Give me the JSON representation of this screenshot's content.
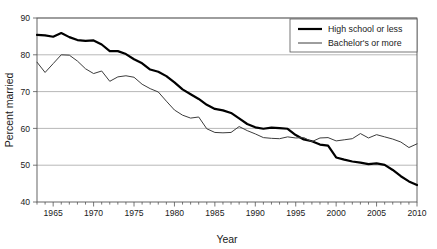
{
  "chart_data": {
    "type": "line",
    "title": "",
    "xlabel": "Year",
    "ylabel": "Percent married",
    "xlim": [
      1963,
      2010
    ],
    "ylim": [
      40,
      90
    ],
    "grid": true,
    "grid_axis": "y",
    "legend_position": "top-right",
    "x_ticks": [
      1965,
      1970,
      1975,
      1980,
      1985,
      1990,
      1995,
      2000,
      2005,
      2010
    ],
    "x_tick_labels": [
      "1965",
      "1970",
      "1975",
      "1980",
      "1985",
      "1990",
      "1995",
      "2000",
      "2005",
      "2010"
    ],
    "x_minor_tick_step": 1,
    "y_ticks": [
      40,
      50,
      60,
      70,
      80,
      90
    ],
    "y_tick_labels": [
      "40",
      "50",
      "60",
      "70",
      "80",
      "90"
    ],
    "x": [
      1963,
      1964,
      1965,
      1966,
      1967,
      1968,
      1969,
      1970,
      1971,
      1972,
      1973,
      1974,
      1975,
      1976,
      1977,
      1978,
      1979,
      1980,
      1981,
      1982,
      1983,
      1984,
      1985,
      1986,
      1987,
      1988,
      1989,
      1990,
      1991,
      1992,
      1993,
      1994,
      1995,
      1996,
      1997,
      1998,
      1999,
      2000,
      2001,
      2002,
      2003,
      2004,
      2005,
      2006,
      2007,
      2008,
      2009,
      2010
    ],
    "series": [
      {
        "name": "High school or less",
        "color": "#000000",
        "line_width": 2.2,
        "values": [
          85.4,
          85.3,
          84.9,
          85.9,
          84.8,
          84.0,
          83.8,
          83.9,
          82.8,
          81.0,
          81.0,
          80.2,
          78.8,
          77.7,
          76.0,
          75.4,
          74.2,
          72.5,
          70.6,
          69.3,
          68.0,
          66.4,
          65.3,
          64.9,
          64.2,
          62.7,
          61.2,
          60.3,
          59.9,
          60.2,
          60.1,
          59.9,
          58.2,
          57.0,
          56.5,
          55.6,
          55.3,
          54.9,
          54.1,
          54.6,
          54.8,
          54.6,
          54.2,
          53.9,
          53.3,
          52.6,
          52.3,
          51.8
        ]
      },
      {
        "name": "Bachelor's or more",
        "color": "#3c3c3c",
        "line_width": 1.0,
        "values": [
          78.0,
          75.2,
          77.6,
          80.0,
          79.9,
          78.3,
          76.2,
          74.9,
          75.6,
          72.8,
          74.0,
          74.3,
          73.9,
          72.0,
          70.8,
          69.9,
          67.4,
          65.0,
          63.6,
          62.8,
          63.1,
          59.9,
          58.9,
          58.8,
          58.9,
          60.5,
          59.4,
          58.5,
          57.5,
          57.3,
          57.2,
          57.7,
          57.4,
          57.5,
          56.4,
          57.4,
          57.5,
          57.0,
          56.4,
          56.3,
          57.0,
          58.6,
          57.3,
          58.2,
          57.9,
          57.0,
          56.6,
          55.9
        ]
      }
    ],
    "series_tail": [
      {
        "name": "High school or less",
        "x": [
          2000,
          2001,
          2002,
          2003,
          2004,
          2005,
          2006,
          2007,
          2008,
          2009,
          2010
        ],
        "values": [
          52.1,
          51.5,
          51.0,
          50.7,
          50.3,
          50.5,
          50.1,
          48.7,
          47.0,
          45.6,
          44.6,
          44.5
        ]
      },
      {
        "name": "Bachelor's or more",
        "x": [
          2000,
          2001,
          2002,
          2003,
          2004,
          2005,
          2006,
          2007,
          2008,
          2009,
          2010
        ],
        "values": [
          56.6,
          56.9,
          57.2,
          58.6,
          57.4,
          58.3,
          57.7,
          57.1,
          56.3,
          54.8,
          55.8,
          52.6
        ]
      }
    ]
  },
  "legend": {
    "items": [
      {
        "label": "High school or less",
        "style": "thick"
      },
      {
        "label": "Bachelor's or more",
        "style": "thin"
      }
    ]
  },
  "axes": {
    "y_title": "Percent married",
    "x_title": "Year"
  },
  "colors": {
    "series_1": "#000000",
    "series_2": "#3c3c3c",
    "grid": "#9a9a9a",
    "frame": "#555555",
    "background": "#ffffff"
  }
}
